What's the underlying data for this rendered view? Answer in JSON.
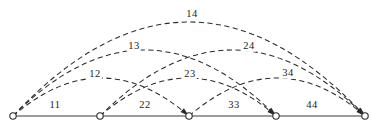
{
  "diagram": {
    "type": "arc-diagram",
    "width": 378,
    "height": 125,
    "background_color": "#ffffff",
    "line_color": "#2b2b2b",
    "baseline_color": "#3a3a3a",
    "node_fill_color": "#ffffff",
    "baseline_y": 116,
    "nodes": [
      {
        "id": "n1",
        "index": 1,
        "x": 13,
        "y": 116,
        "radius": 3.2
      },
      {
        "id": "n2",
        "index": 2,
        "x": 100,
        "y": 116,
        "radius": 3.2
      },
      {
        "id": "n3",
        "index": 3,
        "x": 189,
        "y": 116,
        "radius": 3.2
      },
      {
        "id": "n4",
        "index": 4,
        "x": 276,
        "y": 116,
        "radius": 3.2
      },
      {
        "id": "n5",
        "index": 5,
        "x": 365,
        "y": 116,
        "radius": 3.2
      }
    ],
    "baseline_segments": [
      {
        "id": "seg11",
        "label": "11",
        "from": "n1",
        "to": "n2",
        "label_x": 55,
        "label_y": 105
      },
      {
        "id": "seg22",
        "label": "22",
        "from": "n2",
        "to": "n3",
        "label_x": 145,
        "label_y": 105
      },
      {
        "id": "seg33",
        "label": "33",
        "from": "n3",
        "to": "n4",
        "label_x": 234,
        "label_y": 105
      },
      {
        "id": "seg44",
        "label": "44",
        "from": "n4",
        "to": "n5",
        "label_x": 312,
        "label_y": 105
      }
    ],
    "arcs": [
      {
        "id": "arc12",
        "label": "12",
        "from": "n1",
        "to": "n3",
        "span": 1,
        "tier": 1,
        "x1": 13,
        "x2": 189,
        "apex_y": 78,
        "label_x": 95,
        "label_y": 74,
        "style": "dashed"
      },
      {
        "id": "arc23",
        "label": "23",
        "from": "n2",
        "to": "n4",
        "span": 1,
        "tier": 1,
        "x1": 100,
        "x2": 276,
        "apex_y": 78,
        "label_x": 190,
        "label_y": 74,
        "style": "dashed"
      },
      {
        "id": "arc34",
        "label": "34",
        "from": "n3",
        "to": "n5",
        "span": 1,
        "tier": 1,
        "x1": 189,
        "x2": 365,
        "apex_y": 78,
        "label_x": 288,
        "label_y": 73,
        "style": "dashed"
      },
      {
        "id": "arc13",
        "label": "13",
        "from": "n1",
        "to": "n4",
        "span": 2,
        "tier": 2,
        "x1": 13,
        "x2": 276,
        "apex_y": 50,
        "label_x": 134,
        "label_y": 46,
        "style": "dashed"
      },
      {
        "id": "arc24",
        "label": "24",
        "from": "n2",
        "to": "n5",
        "span": 2,
        "tier": 2,
        "x1": 100,
        "x2": 365,
        "apex_y": 50,
        "label_x": 249,
        "label_y": 46,
        "style": "dashed"
      },
      {
        "id": "arc14",
        "label": "14",
        "from": "n1",
        "to": "n5",
        "span": 3,
        "tier": 3,
        "x1": 13,
        "x2": 365,
        "apex_y": 22,
        "label_x": 192,
        "label_y": 14,
        "style": "dashed"
      }
    ]
  }
}
